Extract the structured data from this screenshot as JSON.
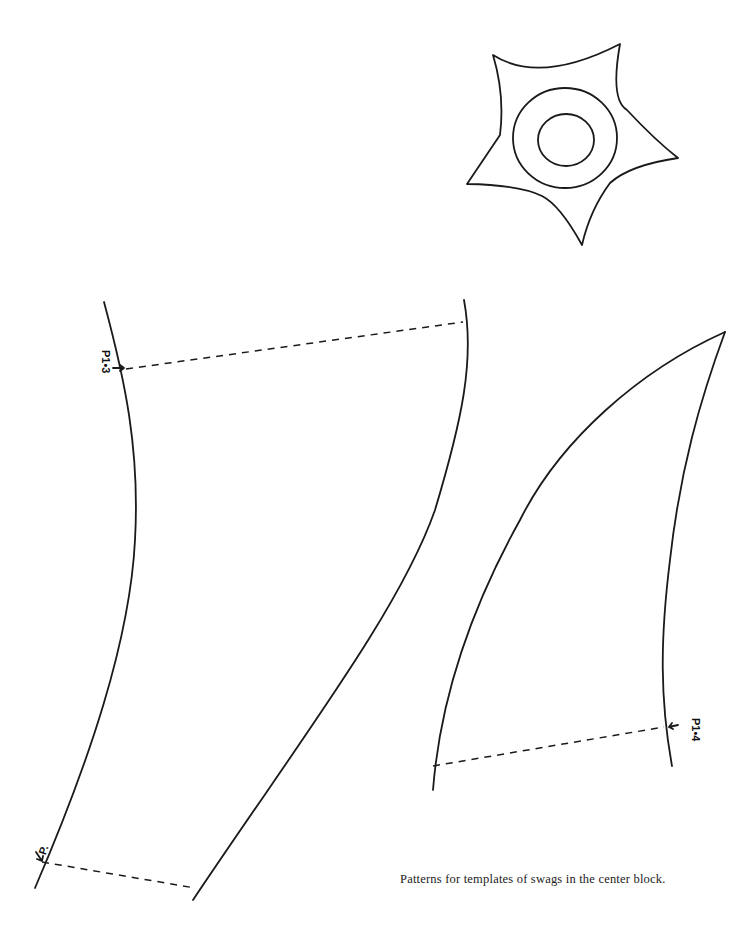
{
  "document": {
    "type": "quilt pattern sheet",
    "caption": "Patterns for templates of swags in the center block.",
    "colors": {
      "background": "#ffffff",
      "ink": "#1a1a1a"
    }
  },
  "patterns": [
    {
      "id": "star",
      "shape": "five-pointed star with two concentric circles",
      "description": "Star appliqué template with inner ring and center circle"
    },
    {
      "id": "swag-left",
      "shape": "long curved swag piece",
      "labels": [
        "P1•3",
        "P."
      ],
      "placement_lines": 2
    },
    {
      "id": "swag-right",
      "shape": "pointed curved swag end",
      "labels": [
        "P1•4"
      ],
      "placement_lines": 1
    }
  ],
  "labels": {
    "top_left": "P1•3",
    "bottom_left": "P.",
    "right": "P1•4"
  }
}
